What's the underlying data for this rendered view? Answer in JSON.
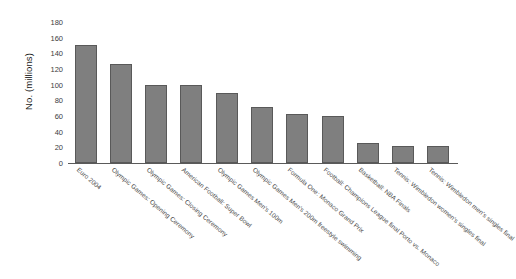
{
  "chart_data": {
    "type": "bar",
    "title": "",
    "xlabel": "",
    "ylabel": "No. (millions)",
    "ylim": [
      0,
      180
    ],
    "yticks": [
      0,
      20,
      40,
      60,
      80,
      100,
      120,
      140,
      160,
      180
    ],
    "grid": false,
    "legend": "none",
    "bar_color": "#7f7f7f",
    "bar_edge_color": "#595959",
    "categories": [
      "Euro 2004",
      "Olympic Games: Opening Ceremony",
      "Olympic Games: Closing Ceremony",
      "American Football: Super Bowl",
      "Olympic Games Men's 100m",
      "Olympic Games Men's 200m freestyle swimming",
      "Formula One: Monaco Grand Prix",
      "Football: Champions League final Porto vs. Monaco",
      "Basketball: NBA Finals",
      "Tennis: Wimbledon women's singles final",
      "Tennis: Wimbledon men's singles final"
    ],
    "values": [
      151,
      127,
      100,
      100,
      90,
      71,
      63,
      60,
      25,
      22,
      22
    ]
  }
}
